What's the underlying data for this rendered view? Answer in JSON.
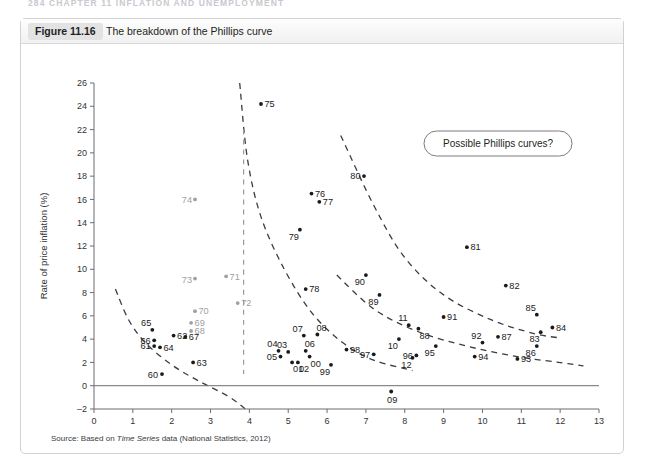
{
  "page_header": "284  CHAPTER 11  INFLATION AND UNEMPLOYMENT",
  "figure": {
    "number_label": "Figure 11.16",
    "title": "The breakdown of the Phillips curve",
    "source": "Source: Based on ",
    "source_italic": "Time Series",
    "source_tail": " data (National Statistics, 2012)"
  },
  "annotation": {
    "label": "Possible Phillips curves?"
  },
  "chart_data": {
    "type": "scatter",
    "title": "The breakdown of the Phillips curve",
    "xlabel": "Unemployment (%)",
    "ylabel": "Rate of price inflation (%)",
    "xlim": [
      0,
      13
    ],
    "ylim": [
      -2,
      26
    ],
    "xticks": [
      0,
      1,
      2,
      3,
      4,
      5,
      6,
      7,
      8,
      9,
      10,
      11,
      12,
      13
    ],
    "yticks": [
      -2,
      0,
      2,
      4,
      6,
      8,
      10,
      12,
      14,
      16,
      18,
      20,
      22,
      24,
      26
    ],
    "grid": false,
    "legend": "none",
    "point_label_field": "year (two digits)",
    "points": [
      {
        "label": "60",
        "x": 1.75,
        "y": 1.0,
        "muted": false
      },
      {
        "label": "61",
        "x": 1.55,
        "y": 3.4,
        "muted": false
      },
      {
        "label": "62",
        "x": 2.05,
        "y": 4.3,
        "muted": false
      },
      {
        "label": "63",
        "x": 2.55,
        "y": 2.0,
        "muted": false
      },
      {
        "label": "64",
        "x": 1.7,
        "y": 3.3,
        "muted": false
      },
      {
        "label": "65",
        "x": 1.5,
        "y": 4.8,
        "muted": false
      },
      {
        "label": "66",
        "x": 1.55,
        "y": 3.9,
        "muted": false
      },
      {
        "label": "67",
        "x": 2.35,
        "y": 4.2,
        "muted": false
      },
      {
        "label": "68",
        "x": 2.5,
        "y": 4.7,
        "muted": true
      },
      {
        "label": "69",
        "x": 2.5,
        "y": 5.4,
        "muted": true
      },
      {
        "label": "70",
        "x": 2.6,
        "y": 6.4,
        "muted": true
      },
      {
        "label": "71",
        "x": 3.4,
        "y": 9.4,
        "muted": true
      },
      {
        "label": "72",
        "x": 3.7,
        "y": 7.1,
        "muted": true
      },
      {
        "label": "73",
        "x": 2.6,
        "y": 9.2,
        "muted": true
      },
      {
        "label": "74",
        "x": 2.6,
        "y": 16.0,
        "muted": true
      },
      {
        "label": "75",
        "x": 4.3,
        "y": 24.2,
        "muted": false
      },
      {
        "label": "76",
        "x": 5.6,
        "y": 16.5,
        "muted": false
      },
      {
        "label": "77",
        "x": 5.8,
        "y": 15.8,
        "muted": false
      },
      {
        "label": "78",
        "x": 5.45,
        "y": 8.3,
        "muted": false
      },
      {
        "label": "79",
        "x": 5.3,
        "y": 13.4,
        "muted": false
      },
      {
        "label": "80",
        "x": 6.95,
        "y": 18.0,
        "muted": false
      },
      {
        "label": "81",
        "x": 9.6,
        "y": 11.9,
        "muted": false
      },
      {
        "label": "82",
        "x": 10.6,
        "y": 8.6,
        "muted": false
      },
      {
        "label": "83",
        "x": 11.5,
        "y": 4.6,
        "muted": false
      },
      {
        "label": "84",
        "x": 11.8,
        "y": 5.0,
        "muted": false
      },
      {
        "label": "85",
        "x": 11.4,
        "y": 6.1,
        "muted": false
      },
      {
        "label": "86",
        "x": 11.4,
        "y": 3.4,
        "muted": false
      },
      {
        "label": "87",
        "x": 10.4,
        "y": 4.2,
        "muted": false
      },
      {
        "label": "88",
        "x": 8.35,
        "y": 4.9,
        "muted": false
      },
      {
        "label": "89",
        "x": 7.35,
        "y": 7.8,
        "muted": false
      },
      {
        "label": "90",
        "x": 7.0,
        "y": 9.5,
        "muted": false
      },
      {
        "label": "91",
        "x": 9.0,
        "y": 5.9,
        "muted": false
      },
      {
        "label": "92",
        "x": 10.0,
        "y": 3.7,
        "muted": false
      },
      {
        "label": "93",
        "x": 10.9,
        "y": 2.3,
        "muted": false
      },
      {
        "label": "94",
        "x": 9.8,
        "y": 2.5,
        "muted": false
      },
      {
        "label": "95",
        "x": 8.8,
        "y": 3.4,
        "muted": false
      },
      {
        "label": "96",
        "x": 8.3,
        "y": 2.6,
        "muted": false
      },
      {
        "label": "97",
        "x": 7.2,
        "y": 2.7,
        "muted": false
      },
      {
        "label": "98",
        "x": 6.5,
        "y": 3.1,
        "muted": false
      },
      {
        "label": "99",
        "x": 6.1,
        "y": 1.8,
        "muted": false
      },
      {
        "label": "00",
        "x": 5.55,
        "y": 2.5,
        "muted": false
      },
      {
        "label": "01",
        "x": 5.1,
        "y": 2.0,
        "muted": false
      },
      {
        "label": "02",
        "x": 5.25,
        "y": 2.0,
        "muted": false
      },
      {
        "label": "03",
        "x": 5.0,
        "y": 2.9,
        "muted": false
      },
      {
        "label": "04",
        "x": 4.75,
        "y": 3.0,
        "muted": false
      },
      {
        "label": "05",
        "x": 4.8,
        "y": 2.5,
        "muted": false
      },
      {
        "label": "06",
        "x": 5.45,
        "y": 3.0,
        "muted": false
      },
      {
        "label": "07",
        "x": 5.4,
        "y": 4.3,
        "muted": false
      },
      {
        "label": "08",
        "x": 5.75,
        "y": 4.4,
        "muted": false
      },
      {
        "label": "09",
        "x": 7.65,
        "y": -0.5,
        "muted": false
      },
      {
        "label": "10",
        "x": 7.85,
        "y": 4.0,
        "muted": false
      },
      {
        "label": "11",
        "x": 8.1,
        "y": 5.2,
        "muted": false
      },
      {
        "label": "12",
        "x": 8.2,
        "y": 2.4,
        "muted": false
      }
    ],
    "curves": [
      {
        "name": "phillips-curve-1960s",
        "points": [
          [
            0.55,
            8.3
          ],
          [
            0.9,
            5.6
          ],
          [
            1.35,
            3.6
          ],
          [
            2.0,
            1.8
          ],
          [
            2.7,
            0.4
          ],
          [
            3.45,
            -0.9
          ],
          [
            3.9,
            -2.0
          ]
        ]
      },
      {
        "name": "phillips-curve-1970s",
        "points": [
          [
            3.75,
            26.0
          ],
          [
            3.95,
            19.5
          ],
          [
            4.3,
            14.5
          ],
          [
            4.9,
            10.0
          ],
          [
            5.6,
            6.3
          ],
          [
            6.4,
            3.7
          ],
          [
            7.2,
            2.2
          ],
          [
            8.2,
            1.3
          ]
        ]
      },
      {
        "name": "phillips-curve-1980s",
        "points": [
          [
            6.35,
            21.5
          ],
          [
            7.2,
            15.5
          ],
          [
            8.0,
            11.0
          ],
          [
            9.0,
            7.8
          ],
          [
            10.2,
            5.7
          ],
          [
            11.3,
            4.5
          ],
          [
            12.0,
            4.1
          ]
        ]
      },
      {
        "name": "phillips-curve-1990s",
        "points": [
          [
            6.25,
            9.5
          ],
          [
            7.2,
            6.6
          ],
          [
            8.3,
            4.7
          ],
          [
            9.6,
            3.4
          ],
          [
            10.9,
            2.5
          ],
          [
            12.2,
            1.9
          ],
          [
            12.6,
            1.7
          ]
        ]
      },
      {
        "name": "phillips-curve-vertical-1974",
        "points": [
          [
            3.85,
            22.0
          ],
          [
            3.85,
            10.0
          ],
          [
            3.85,
            4.0
          ],
          [
            3.85,
            1.0
          ]
        ],
        "style": "grey"
      }
    ]
  }
}
